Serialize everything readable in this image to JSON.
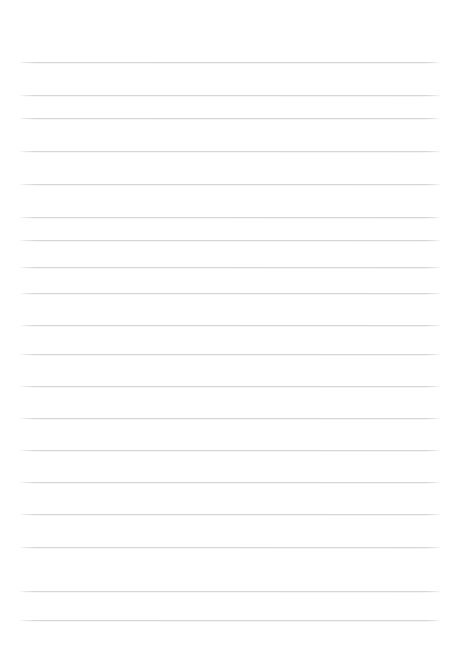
{
  "page": {
    "kind": "ruled-paper-sheet",
    "width": 461,
    "height": 652,
    "background_color": "#ffffff",
    "orientation": "portrait"
  },
  "ruling": {
    "line_color": "#d5d6d8",
    "line_thickness": 1,
    "line_count": 18,
    "line_spacing": 32.8,
    "first_line_y": 62,
    "last_line_y": 620,
    "left_margin": 19,
    "right_margin": 20,
    "line_start_x": 19,
    "line_end_x": 441,
    "line_length": 422,
    "has_vertical_margin_rule": false,
    "has_header_rule": false,
    "lines": [
      {
        "index": 1,
        "y": 62,
        "label": "rule-line-1"
      },
      {
        "index": 2,
        "y": 95,
        "label": "rule-line-2"
      },
      {
        "index": 3,
        "y": 118,
        "label": "rule-line-3"
      },
      {
        "index": 4,
        "y": 151,
        "label": "rule-line-4"
      },
      {
        "index": 5,
        "y": 184,
        "label": "rule-line-5"
      },
      {
        "index": 6,
        "y": 217,
        "label": "rule-line-6"
      },
      {
        "index": 7,
        "y": 240,
        "label": "rule-line-7"
      },
      {
        "index": 8,
        "y": 267,
        "label": "rule-line-8"
      },
      {
        "index": 9,
        "y": 293,
        "label": "rule-line-9"
      },
      {
        "index": 10,
        "y": 325,
        "label": "rule-line-10"
      },
      {
        "index": 11,
        "y": 354,
        "label": "rule-line-11"
      },
      {
        "index": 12,
        "y": 386,
        "label": "rule-line-12"
      },
      {
        "index": 13,
        "y": 418,
        "label": "rule-line-13"
      },
      {
        "index": 14,
        "y": 450,
        "label": "rule-line-14"
      },
      {
        "index": 15,
        "y": 482,
        "label": "rule-line-15"
      },
      {
        "index": 16,
        "y": 514,
        "label": "rule-line-16"
      },
      {
        "index": 17,
        "y": 547,
        "label": "rule-line-17"
      },
      {
        "index": 18,
        "y": 591,
        "label": "rule-line-18"
      },
      {
        "index": 19,
        "y": 620,
        "label": "rule-line-19"
      }
    ]
  },
  "content": {
    "written_text": "",
    "is_blank": true
  }
}
